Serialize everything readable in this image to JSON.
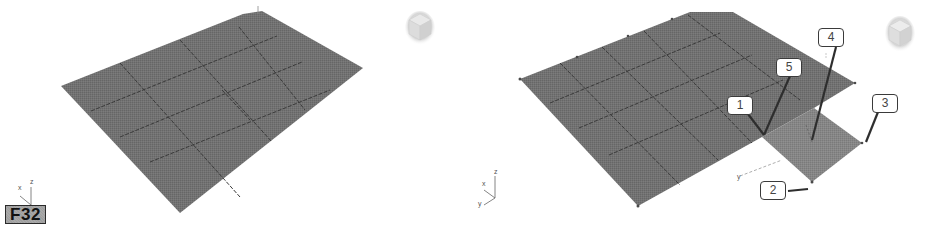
{
  "figure": {
    "badge_label": "F32",
    "left_viewport": {
      "description": "Perspective view of a 4x4 segmented planar surface",
      "axis_tripod": {
        "x_label": "x",
        "z_label": "z"
      },
      "viewcube": "viewcube-icon"
    },
    "right_viewport": {
      "description": "Perspective view of surface with an extended patch and numbered callouts",
      "axis_tripod": {
        "x_label": "x",
        "y_label": "y",
        "z_label": "z"
      },
      "gizmo_axis_label": "y",
      "viewcube": "viewcube-icon",
      "callouts": [
        {
          "id": "1",
          "label": "1"
        },
        {
          "id": "2",
          "label": "2"
        },
        {
          "id": "3",
          "label": "3"
        },
        {
          "id": "4",
          "label": "4"
        },
        {
          "id": "5",
          "label": "5"
        }
      ]
    },
    "colors": {
      "surface": "#707070",
      "surface_patch": "#848484",
      "grid_line": "#3c3c3c",
      "callout_border": "#3a3a3a",
      "badge_bg": "#a9a9a9"
    }
  }
}
